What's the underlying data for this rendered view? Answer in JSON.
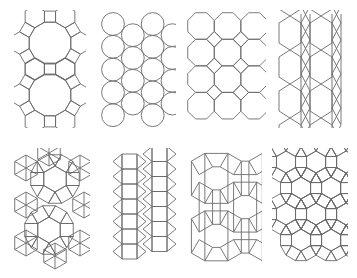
{
  "figure": {
    "background_color": "#ffffff",
    "stroke_color": "#6b6b6b",
    "stroke_width": 0.9,
    "fill_color": "none",
    "columns": 4,
    "rows": 2,
    "width": 357,
    "height": 278
  },
  "panels": [
    {
      "index": 1,
      "name": "truncated-trihexagonal-tiling",
      "label": "4.6.12",
      "description": "Dodecagons surrounded by squares and hexagons",
      "shapes": [
        "dodecagon",
        "square",
        "hexagon"
      ],
      "x": 14,
      "y": 10,
      "w": 72,
      "h": 118
    },
    {
      "index": 2,
      "name": "circle-packing",
      "label": "circles",
      "description": "Staggered columns of tangent circles",
      "shapes": [
        "circle"
      ],
      "x": 100,
      "y": 10,
      "w": 76,
      "h": 118
    },
    {
      "index": 3,
      "name": "truncated-square-tiling",
      "label": "4.8.8",
      "description": "Octagons with small squares at the junctions",
      "shapes": [
        "octagon",
        "square"
      ],
      "x": 186,
      "y": 10,
      "w": 80,
      "h": 118
    },
    {
      "index": 4,
      "name": "elongated-hexagon-triangle-tiling",
      "label": "hex-triangle bands",
      "description": "Columns of elongated hexagons separated by triangle bands",
      "shapes": [
        "hexagon",
        "triangle"
      ],
      "x": 272,
      "y": 10,
      "w": 78,
      "h": 118
    },
    {
      "index": 5,
      "name": "hexagon-square-triangle-tiling",
      "label": "3.4.6.4 variant",
      "description": "Large hexagons ringed by squares and triangles",
      "shapes": [
        "hexagon",
        "square",
        "triangle"
      ],
      "x": 14,
      "y": 148,
      "w": 76,
      "h": 122
    },
    {
      "index": 6,
      "name": "elongated-triangular-tiling",
      "label": "3.3.3.4.4",
      "description": "Vertical columns of squares with zigzag triangle bands",
      "shapes": [
        "square",
        "triangle"
      ],
      "x": 100,
      "y": 148,
      "w": 76,
      "h": 122
    },
    {
      "index": 7,
      "name": "snub-square-tiling",
      "label": "3.3.4.3.4",
      "description": "Pinwheel of tilted squares with triangles between",
      "shapes": [
        "square",
        "triangle"
      ],
      "x": 186,
      "y": 148,
      "w": 76,
      "h": 122
    },
    {
      "index": 8,
      "name": "rhombitrihexagonal-tiling",
      "label": "3.4.6.4",
      "description": "Hexagons, squares and triangles",
      "shapes": [
        "hexagon",
        "square",
        "triangle"
      ],
      "x": 272,
      "y": 148,
      "w": 76,
      "h": 122
    }
  ]
}
